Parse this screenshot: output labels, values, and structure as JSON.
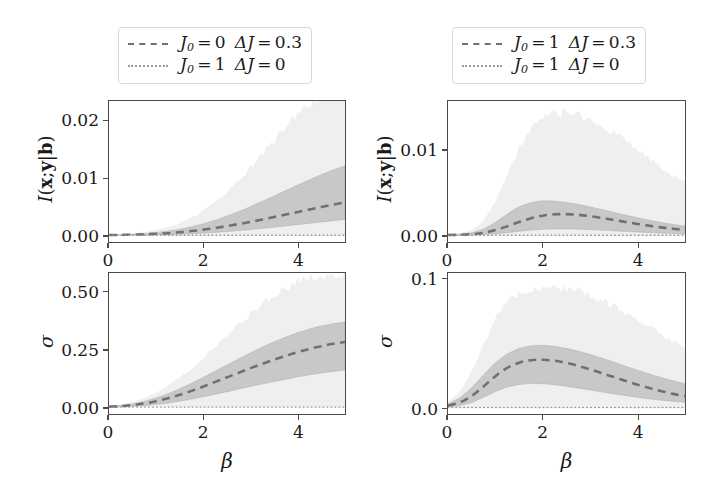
{
  "figure": {
    "background": "#ffffff",
    "line_color": "#707070",
    "dotted_color": "#999999",
    "band_inner_color": "#b8b8b8",
    "band_outer_color": "#ececec",
    "axis_color": "#4b4b4b"
  },
  "legends": [
    {
      "id": "legend-left",
      "entries": [
        {
          "style": "dashed",
          "J0_sym": "J",
          "J0_sub": "0",
          "J0_eq": "=",
          "J0_val": "0",
          "dJ_sym": "ΔJ",
          "dJ_eq": "=",
          "dJ_val": "0.3"
        },
        {
          "style": "dotted",
          "J0_sym": "J",
          "J0_sub": "0",
          "J0_eq": "=",
          "J0_val": "1",
          "dJ_sym": "ΔJ",
          "dJ_eq": "=",
          "dJ_val": "0"
        }
      ]
    },
    {
      "id": "legend-right",
      "entries": [
        {
          "style": "dashed",
          "J0_sym": "J",
          "J0_sub": "0",
          "J0_eq": "=",
          "J0_val": "1",
          "dJ_sym": "ΔJ",
          "dJ_eq": "=",
          "dJ_val": "0.3"
        },
        {
          "style": "dotted",
          "J0_sym": "J",
          "J0_sub": "0",
          "J0_eq": "=",
          "J0_val": "1",
          "dJ_sym": "ΔJ",
          "dJ_eq": "=",
          "dJ_val": "0"
        }
      ]
    }
  ],
  "axis_titles": {
    "x": "β",
    "y_mutual_information": "I(x;y|b)",
    "y_sigma": "σ"
  },
  "chart_data": [
    {
      "id": "top-left",
      "type": "line",
      "title": "",
      "xlabel": "β",
      "ylabel": "I(x;y|b)",
      "xlim": [
        0,
        5
      ],
      "ylim": [
        -0.0012,
        0.0235
      ],
      "xticks": [
        0,
        2,
        4
      ],
      "xticklabels": [
        "0",
        "2",
        "4"
      ],
      "yticks": [
        0.0,
        0.01,
        0.02
      ],
      "yticklabels": [
        "0.00",
        "0.01",
        "0.02"
      ],
      "grid": false,
      "legend_position": "above-axes",
      "x": [
        0,
        0.25,
        0.5,
        0.75,
        1.0,
        1.25,
        1.5,
        1.75,
        2.0,
        2.25,
        2.5,
        2.75,
        3.0,
        3.25,
        3.5,
        3.75,
        4.0,
        4.25,
        4.5,
        4.75,
        5.0
      ],
      "series": [
        {
          "name": "J_0 = 0, ΔJ = 0.3 (mean)",
          "style": "dashed",
          "values": [
            2e-05,
            4e-05,
            8e-05,
            0.00014,
            0.00023,
            0.00035,
            0.00051,
            0.00072,
            0.00097,
            0.00126,
            0.00159,
            0.00195,
            0.00234,
            0.00275,
            0.00318,
            0.00362,
            0.00406,
            0.0045,
            0.00493,
            0.00535,
            0.00575
          ]
        },
        {
          "name": "J_0 = 1, ΔJ = 0 (mean)",
          "style": "dotted",
          "values": [
            0,
            0,
            0,
            0,
            0,
            0,
            0,
            0,
            0,
            0,
            0,
            0,
            0,
            0,
            0,
            0,
            0,
            0,
            0,
            0,
            0
          ]
        }
      ],
      "bands": [
        {
          "name": "outer band",
          "shade": "light",
          "lower": [
            0,
            0,
            0,
            0,
            0,
            0,
            0,
            0,
            0,
            0,
            0,
            0,
            0,
            0,
            0,
            0,
            0,
            0,
            0,
            0,
            0
          ],
          "upper": [
            5e-05,
            0.00012,
            0.00026,
            0.00048,
            0.00082,
            0.00133,
            0.00205,
            0.00302,
            0.00424,
            0.00574,
            0.00752,
            0.00953,
            0.01174,
            0.01408,
            0.01648,
            0.01886,
            0.0211,
            0.02292,
            0.024,
            0.0243,
            0.0242
          ]
        },
        {
          "name": "inner band",
          "shade": "dark",
          "lower": [
            0,
            1e-05,
            2e-05,
            3e-05,
            6e-05,
            0.0001,
            0.00016,
            0.00024,
            0.00034,
            0.00047,
            0.00062,
            0.00079,
            0.00098,
            0.00118,
            0.0014,
            0.00162,
            0.00185,
            0.00208,
            0.00231,
            0.00253,
            0.00274
          ],
          "upper": [
            4e-05,
            8e-05,
            0.00016,
            0.00028,
            0.00046,
            0.00071,
            0.00104,
            0.00146,
            0.00199,
            0.00261,
            0.00333,
            0.00413,
            0.005,
            0.00592,
            0.00687,
            0.00783,
            0.00878,
            0.00971,
            0.0106,
            0.01142,
            0.01215
          ]
        }
      ]
    },
    {
      "id": "bottom-left",
      "type": "line",
      "title": "",
      "xlabel": "β",
      "ylabel": "σ",
      "xlim": [
        0,
        5
      ],
      "ylim": [
        -0.03,
        0.585
      ],
      "xticks": [
        0,
        2,
        4
      ],
      "xticklabels": [
        "0",
        "2",
        "4"
      ],
      "yticks": [
        0.0,
        0.25,
        0.5
      ],
      "yticklabels": [
        "0.00",
        "0.25",
        "0.50"
      ],
      "grid": false,
      "legend_position": "above-axes",
      "x": [
        0,
        0.25,
        0.5,
        0.75,
        1.0,
        1.25,
        1.5,
        1.75,
        2.0,
        2.25,
        2.5,
        2.75,
        3.0,
        3.25,
        3.5,
        3.75,
        4.0,
        4.25,
        4.5,
        4.75,
        5.0
      ],
      "series": [
        {
          "name": "J_0 = 0, ΔJ = 0.3 (mean)",
          "style": "dashed",
          "values": [
            0.002,
            0.004,
            0.009,
            0.016,
            0.026,
            0.039,
            0.054,
            0.071,
            0.09,
            0.11,
            0.13,
            0.15,
            0.17,
            0.189,
            0.207,
            0.224,
            0.24,
            0.254,
            0.266,
            0.276,
            0.284
          ]
        },
        {
          "name": "J_0 = 1, ΔJ = 0 (mean)",
          "style": "dotted",
          "values": [
            0,
            0,
            0,
            0,
            0,
            0,
            0,
            0,
            0,
            0,
            0,
            0,
            0,
            0,
            0,
            0,
            0,
            0,
            0,
            0,
            0
          ]
        }
      ],
      "bands": [
        {
          "name": "outer band",
          "shade": "light",
          "lower": [
            0,
            0,
            0,
            0,
            0,
            0,
            0,
            0,
            0,
            0,
            0,
            0,
            0,
            0,
            0,
            0,
            0,
            0,
            0,
            0,
            0
          ],
          "upper": [
            0.004,
            0.01,
            0.021,
            0.038,
            0.062,
            0.092,
            0.128,
            0.169,
            0.214,
            0.261,
            0.31,
            0.358,
            0.404,
            0.447,
            0.486,
            0.519,
            0.546,
            0.564,
            0.575,
            0.58,
            0.578
          ]
        },
        {
          "name": "inner band",
          "shade": "dark",
          "lower": [
            0.001,
            0.002,
            0.004,
            0.007,
            0.012,
            0.018,
            0.026,
            0.035,
            0.045,
            0.056,
            0.067,
            0.079,
            0.09,
            0.101,
            0.112,
            0.122,
            0.132,
            0.141,
            0.149,
            0.156,
            0.162
          ],
          "upper": [
            0.003,
            0.007,
            0.014,
            0.025,
            0.04,
            0.058,
            0.08,
            0.104,
            0.13,
            0.157,
            0.184,
            0.211,
            0.237,
            0.262,
            0.285,
            0.306,
            0.325,
            0.341,
            0.354,
            0.364,
            0.371
          ]
        }
      ]
    },
    {
      "id": "top-right",
      "type": "line",
      "title": "",
      "xlabel": "β",
      "ylabel": "I(x;y|b)",
      "xlim": [
        0,
        5
      ],
      "ylim": [
        -0.0008,
        0.0158
      ],
      "xticks": [
        0,
        2,
        4
      ],
      "xticklabels": [
        "0",
        "2",
        "4"
      ],
      "yticks": [
        0.0,
        0.01
      ],
      "yticklabels": [
        "0.00",
        "0.01"
      ],
      "grid": false,
      "legend_position": "above-axes",
      "x": [
        0,
        0.25,
        0.5,
        0.75,
        1.0,
        1.25,
        1.5,
        1.75,
        2.0,
        2.25,
        2.5,
        2.75,
        3.0,
        3.25,
        3.5,
        3.75,
        4.0,
        4.25,
        4.5,
        4.75,
        5.0
      ],
      "series": [
        {
          "name": "J_0 = 1, ΔJ = 0.3 (mean)",
          "style": "dashed",
          "values": [
            2e-05,
            5e-05,
            0.00012,
            0.00028,
            0.0006,
            0.00105,
            0.00155,
            0.00199,
            0.0023,
            0.00246,
            0.00248,
            0.0024,
            0.00224,
            0.00203,
            0.0018,
            0.00156,
            0.00133,
            0.00111,
            0.00092,
            0.00075,
            0.00061
          ]
        },
        {
          "name": "J_0 = 1, ΔJ = 0 (mean)",
          "style": "dotted",
          "values": [
            0,
            0,
            0,
            0,
            0,
            0,
            0,
            0,
            0,
            0,
            0,
            0,
            0,
            0,
            0,
            0,
            0,
            0,
            0,
            0,
            0
          ]
        }
      ],
      "bands": [
        {
          "name": "outer band",
          "shade": "light",
          "lower": [
            0,
            0,
            0,
            0,
            0,
            0,
            0,
            0,
            0,
            0,
            0,
            0,
            0,
            0,
            0,
            0,
            0,
            0,
            0,
            0,
            0
          ],
          "upper": [
            6e-05,
            0.00018,
            0.00055,
            0.0016,
            0.0039,
            0.007,
            0.0101,
            0.0125,
            0.0137,
            0.0143,
            0.0145,
            0.0142,
            0.0137,
            0.0129,
            0.012,
            0.0111,
            0.0101,
            0.009,
            0.0079,
            0.0069,
            0.0061
          ]
        },
        {
          "name": "inner band",
          "shade": "dark",
          "lower": [
            0,
            1e-05,
            3e-05,
            7e-05,
            0.00016,
            0.0003,
            0.00046,
            0.0006,
            0.0007,
            0.00074,
            0.00074,
            0.00071,
            0.00065,
            0.00058,
            0.00051,
            0.00044,
            0.00037,
            0.00031,
            0.00025,
            0.0002,
            0.00016
          ],
          "upper": [
            4e-05,
            0.00011,
            0.00028,
            0.0007,
            0.0015,
            0.0025,
            0.00335,
            0.00385,
            0.00405,
            0.00402,
            0.00386,
            0.00362,
            0.00333,
            0.00301,
            0.00268,
            0.00236,
            0.00205,
            0.00176,
            0.0015,
            0.00127,
            0.00107
          ]
        }
      ]
    },
    {
      "id": "bottom-right",
      "type": "line",
      "title": "",
      "xlabel": "β",
      "ylabel": "σ",
      "xlim": [
        0,
        5
      ],
      "ylim": [
        -0.005,
        0.105
      ],
      "xticks": [
        0,
        2,
        4
      ],
      "xticklabels": [
        "0",
        "2",
        "4"
      ],
      "yticks": [
        0.0,
        0.1
      ],
      "yticklabels": [
        "0.0",
        "0.1"
      ],
      "grid": false,
      "legend_position": "above-axes",
      "x": [
        0,
        0.25,
        0.5,
        0.75,
        1.0,
        1.25,
        1.5,
        1.75,
        2.0,
        2.25,
        2.5,
        2.75,
        3.0,
        3.25,
        3.5,
        3.75,
        4.0,
        4.25,
        4.5,
        4.75,
        5.0
      ],
      "series": [
        {
          "name": "J_0 = 1, ΔJ = 0.3 (mean)",
          "style": "dashed",
          "values": [
            0.0015,
            0.004,
            0.009,
            0.0165,
            0.0245,
            0.031,
            0.035,
            0.037,
            0.0373,
            0.0365,
            0.0348,
            0.0325,
            0.0298,
            0.0268,
            0.0238,
            0.0208,
            0.0178,
            0.0152,
            0.0128,
            0.0107,
            0.009
          ]
        },
        {
          "name": "J_0 = 1, ΔJ = 0 (mean)",
          "style": "dotted",
          "values": [
            0,
            0,
            0,
            0,
            0,
            0,
            0,
            0,
            0,
            0,
            0,
            0,
            0,
            0,
            0,
            0,
            0,
            0,
            0,
            0,
            0
          ]
        }
      ],
      "bands": [
        {
          "name": "outer band",
          "shade": "light",
          "lower": [
            0,
            0,
            0,
            0,
            0,
            0,
            0,
            0,
            0,
            0,
            0,
            0,
            0,
            0,
            0,
            0,
            0,
            0,
            0,
            0,
            0
          ],
          "upper": [
            0.004,
            0.012,
            0.028,
            0.048,
            0.068,
            0.082,
            0.089,
            0.092,
            0.093,
            0.093,
            0.092,
            0.09,
            0.087,
            0.083,
            0.079,
            0.074,
            0.069,
            0.063,
            0.057,
            0.051,
            0.046
          ]
        },
        {
          "name": "inner band",
          "shade": "dark",
          "lower": [
            0.0005,
            0.0015,
            0.004,
            0.008,
            0.0125,
            0.016,
            0.018,
            0.0188,
            0.0186,
            0.0178,
            0.0166,
            0.0152,
            0.0137,
            0.0122,
            0.0107,
            0.0093,
            0.008,
            0.0068,
            0.0058,
            0.0049,
            0.0041
          ],
          "upper": [
            0.003,
            0.0075,
            0.0155,
            0.0255,
            0.035,
            0.042,
            0.0462,
            0.0482,
            0.0486,
            0.0478,
            0.0462,
            0.044,
            0.0414,
            0.0385,
            0.0354,
            0.0323,
            0.0292,
            0.0262,
            0.0234,
            0.0208,
            0.0185
          ]
        }
      ]
    }
  ]
}
